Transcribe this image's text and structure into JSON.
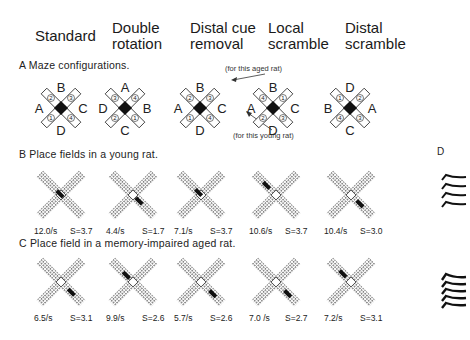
{
  "columns": [
    {
      "title_line1": "Standard",
      "title_line2": ""
    },
    {
      "title_line1": "Double",
      "title_line2": "rotation"
    },
    {
      "title_line1": "Distal cue",
      "title_line2": "removal"
    },
    {
      "title_line1": "Local",
      "title_line2": "scramble"
    },
    {
      "title_line1": "Distal",
      "title_line2": "scramble"
    }
  ],
  "sections": {
    "A": {
      "label": "A  Maze configurations."
    },
    "B": {
      "label": "B  Place fields in a young rat."
    },
    "C": {
      "label": "C  Place field in a memory-impaired aged rat."
    },
    "D": {
      "label": "D"
    }
  },
  "annotations": {
    "aged": "(for this aged rat)",
    "young": "(for this young rat)"
  },
  "mazes": [
    {
      "top": "B",
      "left": "A",
      "right": "C",
      "bottom": "D",
      "arm_tl": "2",
      "arm_tr": "3",
      "arm_bl": "1",
      "arm_br": "4"
    },
    {
      "top": "A",
      "left": "D",
      "right": "B",
      "bottom": "C",
      "arm_tl": "3",
      "arm_tr": "4",
      "arm_bl": "2",
      "arm_br": "1"
    },
    {
      "top": "B",
      "left": "A",
      "right": "C",
      "bottom": "D",
      "arm_tl": "2",
      "arm_tr": "3",
      "arm_bl": "1",
      "arm_br": "4"
    },
    {
      "top": "B",
      "left": "A",
      "right": "C",
      "bottom": "D",
      "arm_tl": "4",
      "arm_tr": "1",
      "arm_bl": "2",
      "arm_br": "3"
    },
    {
      "top": "D",
      "left": "B",
      "right": "A",
      "bottom": "C",
      "arm_tl": "1",
      "arm_tr": "2",
      "arm_bl": "4",
      "arm_br": "3"
    }
  ],
  "young_rat": [
    {
      "rate": "12.0/s",
      "s": "S=3.7"
    },
    {
      "rate": "4.4/s",
      "s": "S=1.7"
    },
    {
      "rate": "7.1/s",
      "s": "S=3.7"
    },
    {
      "rate": "10.6/s",
      "s": "S=3.7"
    },
    {
      "rate": "10.4/s",
      "s": "S=3.0"
    }
  ],
  "aged_rat": [
    {
      "rate": "6.5/s",
      "s": "S=3.1"
    },
    {
      "rate": "9.9/s",
      "s": "S=2.6"
    },
    {
      "rate": "5.7/s",
      "s": "S=2.6"
    },
    {
      "rate": "7.0  /s",
      "s": "S=2.7"
    },
    {
      "rate": "7.2/s",
      "s": "S=3.1"
    }
  ]
}
